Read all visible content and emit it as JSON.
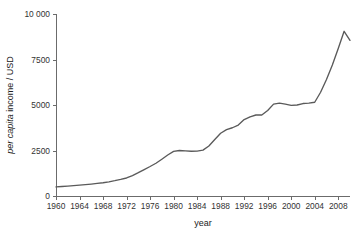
{
  "chart_data": {
    "type": "line",
    "title": "",
    "xlabel": "year",
    "ylabel": "per capita income / USD",
    "ylabel_italic_part": "per capita",
    "ylabel_roman_part": " income / USD",
    "xlim": [
      1960,
      2010
    ],
    "ylim": [
      0,
      10000
    ],
    "grid": false,
    "legend": false,
    "ytick_labels": [
      "10 000",
      "7500",
      "5000",
      "2500",
      "0"
    ],
    "ytick_values": [
      10000,
      7500,
      5000,
      2500,
      0
    ],
    "xtick_labels": [
      "1960",
      "1964",
      "1968",
      "1972",
      "1976",
      "1980",
      "1984",
      "1988",
      "1992",
      "1996",
      "2000",
      "2004",
      "2008"
    ],
    "xtick_values": [
      1960,
      1964,
      1968,
      1972,
      1976,
      1980,
      1984,
      1988,
      1992,
      1996,
      2000,
      2004,
      2008
    ],
    "line_color": "#5a5a5a",
    "axis_color": "#6b6b6b",
    "series": [
      {
        "name": "per capita income",
        "x": [
          1960,
          1961,
          1962,
          1963,
          1964,
          1965,
          1966,
          1967,
          1968,
          1969,
          1970,
          1971,
          1972,
          1973,
          1974,
          1975,
          1976,
          1977,
          1978,
          1979,
          1980,
          1981,
          1982,
          1983,
          1984,
          1985,
          1986,
          1987,
          1988,
          1989,
          1990,
          1991,
          1992,
          1993,
          1994,
          1995,
          1996,
          1997,
          1998,
          1999,
          2000,
          2001,
          2002,
          2003,
          2004,
          2005,
          2006,
          2007,
          2008,
          2009,
          2010
        ],
        "y": [
          500,
          520,
          545,
          570,
          595,
          625,
          655,
          690,
          730,
          780,
          840,
          910,
          990,
          1120,
          1280,
          1450,
          1620,
          1800,
          2020,
          2250,
          2450,
          2500,
          2480,
          2460,
          2470,
          2520,
          2750,
          3100,
          3450,
          3650,
          3750,
          3900,
          4200,
          4350,
          4450,
          4450,
          4700,
          5050,
          5100,
          5050,
          4980,
          5000,
          5080,
          5100,
          5150,
          5700,
          6400,
          7200,
          8100,
          9050,
          8550
        ]
      }
    ]
  },
  "geometry": {
    "plot_left": 56,
    "plot_right": 350,
    "plot_top": 14,
    "plot_bottom": 196
  }
}
